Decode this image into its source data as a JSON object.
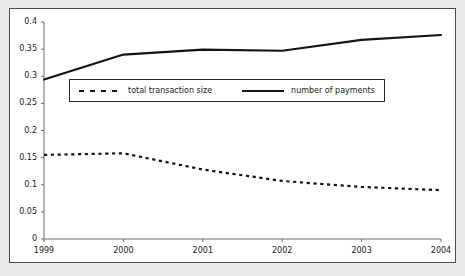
{
  "chart_data": {
    "type": "line",
    "title": "",
    "subtitle": "",
    "xlabel": "",
    "ylabel": "",
    "x": [
      1999,
      2000,
      2001,
      2002,
      2003,
      2004
    ],
    "categories": [
      "1999",
      "2000",
      "2001",
      "2002",
      "2003",
      "2004"
    ],
    "xlim": [
      1999,
      2004
    ],
    "ylim": [
      0,
      0.4
    ],
    "grid": false,
    "legend_position": "upper left",
    "y_ticks": [
      0,
      0.05,
      0.1,
      0.15,
      0.2,
      0.25,
      0.3,
      0.35,
      0.4
    ],
    "y_tick_labels": [
      "0",
      "0.05",
      "0.1",
      "0.15",
      "0.2",
      "0.25",
      "0.3",
      "0.35",
      "0.4"
    ],
    "x_ticks": [
      1999,
      2000,
      2001,
      2002,
      2003,
      2004
    ],
    "x_tick_labels": [
      "1999",
      "2000",
      "2001",
      "2002",
      "2003",
      "2004"
    ],
    "series": [
      {
        "name": "total transaction size",
        "style": "dashed",
        "color": "#141414",
        "values": [
          0.155,
          0.158,
          0.128,
          0.107,
          0.096,
          0.09
        ]
      },
      {
        "name": "number of payments",
        "style": "solid",
        "color": "#141414",
        "values": [
          0.294,
          0.34,
          0.349,
          0.347,
          0.367,
          0.376
        ]
      }
    ]
  },
  "legend": {
    "entries": [
      {
        "label": "total transaction size",
        "style": "dashed"
      },
      {
        "label": "number of payments",
        "style": "solid"
      }
    ]
  },
  "colors": {
    "line": "#141414",
    "axis": "#6b6b6b",
    "frame": "#4a4a4a",
    "page_background": "#e9e9e9",
    "plot_background": "#ffffff"
  }
}
